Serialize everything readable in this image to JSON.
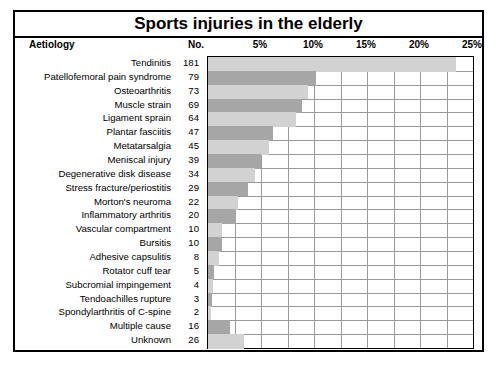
{
  "title": "Sports injuries in the elderly",
  "columns": {
    "aetiology": "Aetiology",
    "number": "No."
  },
  "chart_data": {
    "type": "bar",
    "orientation": "horizontal",
    "title": "Sports injuries in the elderly",
    "xlabel": "",
    "ylabel": "Aetiology",
    "xlim": [
      0,
      25
    ],
    "grid": true,
    "legend": null,
    "tick_labels": [
      "5%",
      "10%",
      "15%",
      "20%",
      "25%"
    ],
    "tick_values": [
      5,
      10,
      15,
      20,
      25
    ],
    "minor_grid_step": 2.5,
    "categories": [
      "Tendinitis",
      "Patellofemoral pain syndrome",
      "Osteoarthritis",
      "Muscle strain",
      "Ligament sprain",
      "Plantar fasciitis",
      "Metatarsalgia",
      "Meniscal injury",
      "Degenerative disk disease",
      "Stress fracture/periostitis",
      "Morton's neuroma",
      "Inflammatory arthritis",
      "Vascular compartment",
      "Bursitis",
      "Adhesive capsulitis",
      "Rotator cuff tear",
      "Subcromial impingement",
      "Tendoachilles rupture",
      "Spondylarthritis of C-spine",
      "Multiple cause",
      "Unknown"
    ],
    "counts": [
      181,
      79,
      73,
      69,
      64,
      47,
      45,
      39,
      34,
      29,
      22,
      20,
      10,
      10,
      8,
      5,
      4,
      3,
      2,
      16,
      26
    ],
    "values": [
      23.4,
      10.2,
      9.4,
      8.9,
      8.3,
      6.1,
      5.8,
      5.0,
      4.4,
      3.8,
      2.8,
      2.6,
      1.3,
      1.3,
      1.0,
      0.6,
      0.5,
      0.4,
      0.3,
      2.1,
      3.4
    ]
  },
  "colors": {
    "bar_light": "#d2d2d2",
    "bar_dark": "#a6a6a6",
    "border": "#000000",
    "grid": "#9a9a9a"
  }
}
